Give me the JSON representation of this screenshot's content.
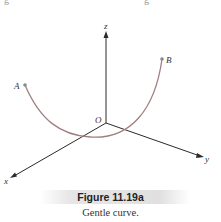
{
  "figure": {
    "number_label": "Figure 11.19a",
    "caption": "Gentle curve.",
    "axes": {
      "x_label": "x",
      "y_label": "y",
      "z_label": "z",
      "origin_label": "O"
    },
    "points": {
      "start_label": "A",
      "end_label": "B"
    },
    "colors": {
      "curve": "#a07f80",
      "axes": "#2a2a2a",
      "caption_bar": "#e2e2e2"
    }
  },
  "top_fragment": {
    "left": "g",
    "right": "g"
  }
}
